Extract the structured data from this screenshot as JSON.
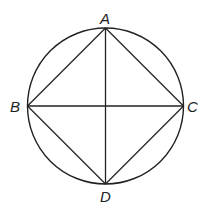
{
  "diagram": {
    "circle": {
      "cx": 105.5,
      "cy": 106,
      "r": 78
    },
    "points": {
      "A": {
        "label": "A",
        "x": 105.5,
        "y": 28
      },
      "B": {
        "label": "B",
        "x": 27.5,
        "y": 106
      },
      "C": {
        "label": "C",
        "x": 183.5,
        "y": 106
      },
      "D": {
        "label": "D",
        "x": 105.5,
        "y": 184
      }
    },
    "segments": [
      "AB",
      "AC",
      "BD",
      "CD",
      "AD",
      "BC"
    ],
    "stroke_color": "#222222"
  }
}
